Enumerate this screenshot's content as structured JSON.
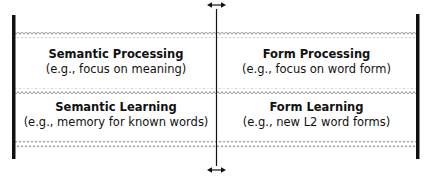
{
  "diagram": {
    "top_arrow": "double-headed-horizontal-arrow",
    "bottom_arrow": "double-headed-horizontal-arrow",
    "cells": [
      {
        "title": "Semantic Processing",
        "subtitle": "(e.g., focus on meaning)"
      },
      {
        "title": "Form Processing",
        "subtitle": "(e.g., focus on word form)"
      },
      {
        "title": "Semantic Learning",
        "subtitle": "(e.g., memory for known words)"
      },
      {
        "title": "Form Learning",
        "subtitle": "(e.g., new L2 word forms)"
      }
    ],
    "colors": {
      "line": "#111111",
      "wavy": "#9a9a9a",
      "background": "#ffffff"
    }
  }
}
